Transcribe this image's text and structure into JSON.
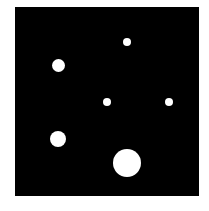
{
  "panel": {
    "x": 15,
    "y": 7,
    "width": 184,
    "height": 189,
    "color": "#000000"
  },
  "dots": [
    {
      "cx": 127,
      "cy": 42,
      "r": 4
    },
    {
      "cx": 58,
      "cy": 65,
      "r": 6.5
    },
    {
      "cx": 107,
      "cy": 102,
      "r": 4
    },
    {
      "cx": 169,
      "cy": 102,
      "r": 4
    },
    {
      "cx": 58,
      "cy": 139,
      "r": 8
    },
    {
      "cx": 127,
      "cy": 163,
      "r": 14
    }
  ],
  "dot_color": "#ffffff"
}
